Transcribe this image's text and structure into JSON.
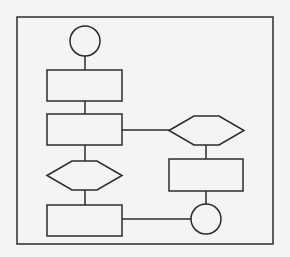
{
  "diagram": {
    "type": "flowchart",
    "colors": {
      "stroke": "#2b2b2b",
      "background": "#f4f4f4"
    },
    "nodes": [
      {
        "id": "start",
        "shape": "circle",
        "label": ""
      },
      {
        "id": "process1",
        "shape": "rectangle",
        "label": ""
      },
      {
        "id": "process2",
        "shape": "rectangle",
        "label": ""
      },
      {
        "id": "decision1",
        "shape": "hexagon",
        "label": ""
      },
      {
        "id": "process3",
        "shape": "rectangle",
        "label": ""
      },
      {
        "id": "decision2",
        "shape": "hexagon",
        "label": ""
      },
      {
        "id": "process4",
        "shape": "rectangle",
        "label": ""
      },
      {
        "id": "end",
        "shape": "circle",
        "label": ""
      }
    ],
    "edges": [
      {
        "from": "start",
        "to": "process1"
      },
      {
        "from": "process1",
        "to": "process2"
      },
      {
        "from": "process2",
        "to": "decision1"
      },
      {
        "from": "decision1",
        "to": "process3"
      },
      {
        "from": "process2",
        "to": "decision2"
      },
      {
        "from": "decision2",
        "to": "process4"
      },
      {
        "from": "process4",
        "to": "end"
      },
      {
        "from": "process3",
        "to": "end"
      }
    ]
  }
}
